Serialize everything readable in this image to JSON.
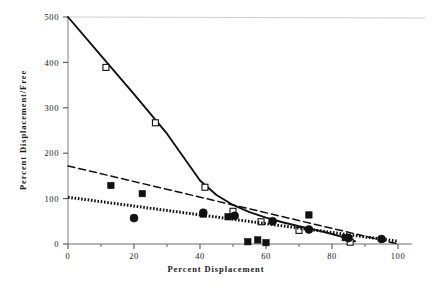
{
  "chart_data": {
    "type": "scatter",
    "title": "",
    "xlabel": "Percent Displacement",
    "ylabel": "Percent Displacement/Free",
    "xlim": [
      0,
      100
    ],
    "ylim": [
      0,
      500
    ],
    "xticks": [
      0,
      20,
      40,
      60,
      80,
      100
    ],
    "xtick_labels": [
      "0",
      "20",
      "40",
      "60",
      "80",
      "100"
    ],
    "xminorticks": [
      10,
      30,
      50,
      70,
      90
    ],
    "yticks": [
      0,
      100,
      200,
      300,
      400,
      500
    ],
    "ytick_labels": [
      "0",
      "100",
      "200",
      "300",
      "400",
      "500"
    ],
    "grid": false,
    "legend": "none",
    "series": [
      {
        "name": "series-solid-open-square",
        "linestyle": "solid",
        "marker": "open-square",
        "color": "#111111",
        "points": [
          {
            "x": 11.5,
            "y": 389
          },
          {
            "x": 26.5,
            "y": 267
          },
          {
            "x": 41.5,
            "y": 125
          },
          {
            "x": 50.0,
            "y": 72
          },
          {
            "x": 58.5,
            "y": 49
          },
          {
            "x": 70.0,
            "y": 30
          },
          {
            "x": 85.5,
            "y": 4
          }
        ],
        "fit_points": [
          {
            "x": 0,
            "y": 500
          },
          {
            "x": 10,
            "y": 415
          },
          {
            "x": 20,
            "y": 330
          },
          {
            "x": 30,
            "y": 243
          },
          {
            "x": 40,
            "y": 140
          },
          {
            "x": 45,
            "y": 108
          },
          {
            "x": 50,
            "y": 86
          },
          {
            "x": 55,
            "y": 70
          },
          {
            "x": 60,
            "y": 58
          },
          {
            "x": 65,
            "y": 48
          },
          {
            "x": 70,
            "y": 39
          },
          {
            "x": 75,
            "y": 31
          },
          {
            "x": 80,
            "y": 22
          },
          {
            "x": 85,
            "y": 12
          },
          {
            "x": 87,
            "y": 6
          }
        ]
      },
      {
        "name": "series-dashed-filled-square",
        "linestyle": "dashed",
        "marker": "filled-square",
        "color": "#111111",
        "points": [
          {
            "x": 13.0,
            "y": 129
          },
          {
            "x": 22.5,
            "y": 111
          },
          {
            "x": 41.0,
            "y": 66
          },
          {
            "x": 48.5,
            "y": 60
          },
          {
            "x": 54.5,
            "y": 5
          },
          {
            "x": 57.5,
            "y": 9
          },
          {
            "x": 60.0,
            "y": 3
          },
          {
            "x": 73.0,
            "y": 64
          },
          {
            "x": 84.0,
            "y": 14
          }
        ],
        "fit_points": [
          {
            "x": 0,
            "y": 172
          },
          {
            "x": 100,
            "y": 0
          }
        ]
      },
      {
        "name": "series-dotted-filled-circle",
        "linestyle": "dotted",
        "marker": "filled-circle",
        "color": "#111111",
        "points": [
          {
            "x": 20.0,
            "y": 57
          },
          {
            "x": 41.0,
            "y": 69
          },
          {
            "x": 50.5,
            "y": 62
          },
          {
            "x": 62.0,
            "y": 50
          },
          {
            "x": 73.0,
            "y": 32
          },
          {
            "x": 85.0,
            "y": 13
          },
          {
            "x": 95.0,
            "y": 11
          }
        ],
        "fit_points": [
          {
            "x": 0,
            "y": 103
          },
          {
            "x": 100,
            "y": 6
          }
        ]
      }
    ]
  },
  "axes": {
    "x_title": "Percent Displacement",
    "y_title": "Percent Displacement/Free"
  }
}
